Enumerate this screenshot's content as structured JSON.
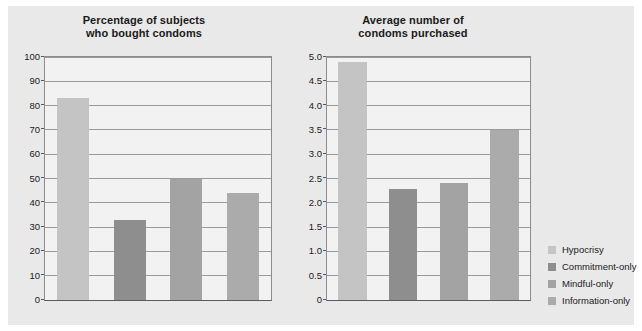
{
  "figure": {
    "background_color": "#e9e9e9",
    "plot_background_color": "#f2f2f2",
    "axis_color": "#5a5a5a",
    "grid_color": "#9a9a9a"
  },
  "legend": {
    "position": "right",
    "items": [
      {
        "label": "Hypocrisy",
        "color": "#c4c4c4"
      },
      {
        "label": "Commitment-only",
        "color": "#8e8e8e"
      },
      {
        "label": "Mindful-only",
        "color": "#a3a3a3"
      },
      {
        "label": "Information-only",
        "color": "#ababab"
      }
    ]
  },
  "chart_data": [
    {
      "type": "bar",
      "title": "Percentage of subjects who bought condoms",
      "title_line1": "Percentage of subjects",
      "title_line2": "who bought condoms",
      "xlabel": "",
      "ylabel": "",
      "ylim": [
        0,
        100
      ],
      "yticks": [
        0,
        10,
        20,
        30,
        40,
        50,
        60,
        70,
        80,
        90,
        100
      ],
      "ytick_labels": [
        "0",
        "10",
        "20",
        "30",
        "40",
        "50",
        "60",
        "70",
        "80",
        "90",
        "100"
      ],
      "grid": true,
      "categories": [
        "Hypocrisy",
        "Commitment-only",
        "Mindful-only",
        "Information-only"
      ],
      "values": [
        83,
        33,
        50,
        44
      ],
      "colors": [
        "#c4c4c4",
        "#8e8e8e",
        "#a3a3a3",
        "#ababab"
      ]
    },
    {
      "type": "bar",
      "title": "Average number of condoms purchased",
      "title_line1": "Average number of",
      "title_line2": "condoms purchased",
      "xlabel": "",
      "ylabel": "",
      "ylim": [
        0,
        5
      ],
      "yticks": [
        0,
        0.5,
        1.0,
        1.5,
        2.0,
        2.5,
        3.0,
        3.5,
        4.0,
        4.5,
        5.0
      ],
      "ytick_labels": [
        "0",
        "0.5",
        "1.0",
        "1.5",
        "2.0",
        "2.5",
        "3.0",
        "3.5",
        "4.0",
        "4.5",
        "5.0"
      ],
      "grid": true,
      "categories": [
        "Hypocrisy",
        "Commitment-only",
        "Mindful-only",
        "Information-only"
      ],
      "values": [
        4.9,
        2.28,
        2.4,
        3.5
      ],
      "colors": [
        "#c4c4c4",
        "#8e8e8e",
        "#a3a3a3",
        "#ababab"
      ]
    }
  ]
}
